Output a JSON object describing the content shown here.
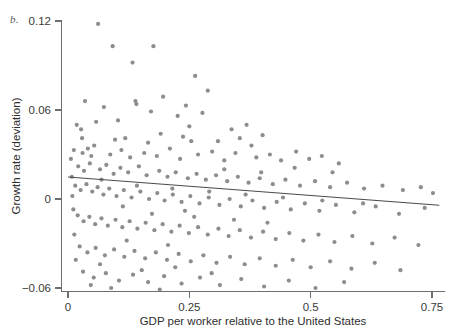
{
  "figure": {
    "panel_label": "b.",
    "background_color": "#ffffff"
  },
  "chart_data": {
    "type": "scatter",
    "title": "",
    "subtitle": "",
    "xlabel": "GDP per worker relative to the United States",
    "ylabel": "Growth rate (deviation)",
    "xlim": [
      0,
      0.78
    ],
    "ylim": [
      -0.068,
      0.125
    ],
    "xticks": [
      0,
      0.25,
      0.5,
      0.75
    ],
    "xtick_labels": [
      "0",
      "0.25",
      "0.5",
      "0.75"
    ],
    "yticks": [
      -0.06,
      0,
      0.06,
      0.12
    ],
    "ytick_labels": [
      "−0.06",
      "0",
      "0.06",
      "0.12"
    ],
    "grid": false,
    "legend": null,
    "marker": {
      "shape": "circle",
      "color": "#8d8d8d",
      "size_px": 4.2
    },
    "trend_line": {
      "type": "linear-fit",
      "color": "#4a4a4a",
      "x_start": 0.0,
      "y_start": 0.0148,
      "x_end": 0.765,
      "y_end": -0.0042,
      "slope": -0.0248,
      "intercept": 0.0148
    },
    "points": [
      [
        0.062,
        0.118
      ],
      [
        0.092,
        0.103
      ],
      [
        0.133,
        0.092
      ],
      [
        0.176,
        0.103
      ],
      [
        0.262,
        0.083
      ],
      [
        0.288,
        0.073
      ],
      [
        0.035,
        0.066
      ],
      [
        0.074,
        0.062
      ],
      [
        0.139,
        0.066
      ],
      [
        0.141,
        0.064
      ],
      [
        0.171,
        0.059
      ],
      [
        0.196,
        0.069
      ],
      [
        0.243,
        0.063
      ],
      [
        0.277,
        0.058
      ],
      [
        0.018,
        0.05
      ],
      [
        0.027,
        0.047
      ],
      [
        0.058,
        0.052
      ],
      [
        0.103,
        0.053
      ],
      [
        0.226,
        0.056
      ],
      [
        0.25,
        0.049
      ],
      [
        0.337,
        0.047
      ],
      [
        0.368,
        0.05
      ],
      [
        0.097,
        0.04
      ],
      [
        0.118,
        0.041
      ],
      [
        0.165,
        0.038
      ],
      [
        0.191,
        0.044
      ],
      [
        0.237,
        0.042
      ],
      [
        0.254,
        0.039
      ],
      [
        0.309,
        0.039
      ],
      [
        0.354,
        0.041
      ],
      [
        0.378,
        0.036
      ],
      [
        0.401,
        0.043
      ],
      [
        0.012,
        0.033
      ],
      [
        0.03,
        0.031
      ],
      [
        0.041,
        0.034
      ],
      [
        0.048,
        0.029
      ],
      [
        0.054,
        0.036
      ],
      [
        0.087,
        0.03
      ],
      [
        0.11,
        0.033
      ],
      [
        0.128,
        0.028
      ],
      [
        0.157,
        0.031
      ],
      [
        0.183,
        0.029
      ],
      [
        0.21,
        0.034
      ],
      [
        0.231,
        0.027
      ],
      [
        0.268,
        0.03
      ],
      [
        0.297,
        0.032
      ],
      [
        0.322,
        0.026
      ],
      [
        0.345,
        0.031
      ],
      [
        0.388,
        0.028
      ],
      [
        0.416,
        0.03
      ],
      [
        0.439,
        0.026
      ],
      [
        0.47,
        0.032
      ],
      [
        0.497,
        0.027
      ],
      [
        0.523,
        0.029
      ],
      [
        0.558,
        0.024
      ],
      [
        0.021,
        0.022
      ],
      [
        0.033,
        0.019
      ],
      [
        0.045,
        0.024
      ],
      [
        0.066,
        0.02
      ],
      [
        0.079,
        0.023
      ],
      [
        0.094,
        0.017
      ],
      [
        0.108,
        0.021
      ],
      [
        0.124,
        0.018
      ],
      [
        0.146,
        0.022
      ],
      [
        0.162,
        0.016
      ],
      [
        0.188,
        0.019
      ],
      [
        0.205,
        0.015
      ],
      [
        0.222,
        0.018
      ],
      [
        0.247,
        0.014
      ],
      [
        0.265,
        0.017
      ],
      [
        0.284,
        0.013
      ],
      [
        0.305,
        0.016
      ],
      [
        0.328,
        0.012
      ],
      [
        0.35,
        0.015
      ],
      [
        0.372,
        0.011
      ],
      [
        0.395,
        0.014
      ],
      [
        0.422,
        0.01
      ],
      [
        0.448,
        0.013
      ],
      [
        0.478,
        0.009
      ],
      [
        0.509,
        0.012
      ],
      [
        0.54,
        0.008
      ],
      [
        0.575,
        0.011
      ],
      [
        0.61,
        0.007
      ],
      [
        0.648,
        0.009
      ],
      [
        0.69,
        0.006
      ],
      [
        0.727,
        0.008
      ],
      [
        0.752,
        0.004
      ],
      [
        0.015,
        0.009
      ],
      [
        0.026,
        0.006
      ],
      [
        0.038,
        0.01
      ],
      [
        0.05,
        0.005
      ],
      [
        0.061,
        0.008
      ],
      [
        0.073,
        0.003
      ],
      [
        0.085,
        0.007
      ],
      [
        0.1,
        0.002
      ],
      [
        0.115,
        0.006
      ],
      [
        0.131,
        0.001
      ],
      [
        0.149,
        0.005
      ],
      [
        0.167,
        0.0
      ],
      [
        0.184,
        0.004
      ],
      [
        0.199,
        -0.001
      ],
      [
        0.216,
        0.003
      ],
      [
        0.234,
        -0.002
      ],
      [
        0.252,
        0.002
      ],
      [
        0.271,
        -0.003
      ],
      [
        0.29,
        0.001
      ],
      [
        0.312,
        -0.004
      ],
      [
        0.333,
        0.0
      ],
      [
        0.356,
        -0.005
      ],
      [
        0.38,
        -0.001
      ],
      [
        0.404,
        -0.006
      ],
      [
        0.43,
        -0.002
      ],
      [
        0.459,
        -0.007
      ],
      [
        0.488,
        -0.003
      ],
      [
        0.518,
        -0.008
      ],
      [
        0.552,
        -0.004
      ],
      [
        0.59,
        -0.009
      ],
      [
        0.634,
        -0.005
      ],
      [
        0.682,
        -0.01
      ],
      [
        0.735,
        -0.006
      ],
      [
        0.02,
        -0.011
      ],
      [
        0.032,
        -0.015
      ],
      [
        0.044,
        -0.012
      ],
      [
        0.056,
        -0.017
      ],
      [
        0.069,
        -0.013
      ],
      [
        0.082,
        -0.018
      ],
      [
        0.098,
        -0.014
      ],
      [
        0.112,
        -0.019
      ],
      [
        0.127,
        -0.015
      ],
      [
        0.143,
        -0.02
      ],
      [
        0.16,
        -0.016
      ],
      [
        0.178,
        -0.021
      ],
      [
        0.195,
        -0.017
      ],
      [
        0.213,
        -0.022
      ],
      [
        0.23,
        -0.018
      ],
      [
        0.249,
        -0.023
      ],
      [
        0.268,
        -0.019
      ],
      [
        0.288,
        -0.024
      ],
      [
        0.31,
        -0.02
      ],
      [
        0.331,
        -0.025
      ],
      [
        0.354,
        -0.021
      ],
      [
        0.377,
        -0.026
      ],
      [
        0.402,
        -0.022
      ],
      [
        0.428,
        -0.027
      ],
      [
        0.456,
        -0.023
      ],
      [
        0.485,
        -0.028
      ],
      [
        0.516,
        -0.024
      ],
      [
        0.549,
        -0.029
      ],
      [
        0.586,
        -0.025
      ],
      [
        0.627,
        -0.03
      ],
      [
        0.673,
        -0.026
      ],
      [
        0.722,
        -0.031
      ],
      [
        0.024,
        -0.032
      ],
      [
        0.04,
        -0.036
      ],
      [
        0.057,
        -0.033
      ],
      [
        0.076,
        -0.038
      ],
      [
        0.095,
        -0.034
      ],
      [
        0.116,
        -0.039
      ],
      [
        0.137,
        -0.035
      ],
      [
        0.159,
        -0.04
      ],
      [
        0.181,
        -0.036
      ],
      [
        0.204,
        -0.041
      ],
      [
        0.228,
        -0.037
      ],
      [
        0.253,
        -0.042
      ],
      [
        0.279,
        -0.038
      ],
      [
        0.306,
        -0.043
      ],
      [
        0.334,
        -0.039
      ],
      [
        0.364,
        -0.044
      ],
      [
        0.395,
        -0.04
      ],
      [
        0.428,
        -0.045
      ],
      [
        0.463,
        -0.041
      ],
      [
        0.5,
        -0.046
      ],
      [
        0.54,
        -0.042
      ],
      [
        0.584,
        -0.047
      ],
      [
        0.632,
        -0.043
      ],
      [
        0.685,
        -0.048
      ],
      [
        0.031,
        -0.049
      ],
      [
        0.053,
        -0.053
      ],
      [
        0.078,
        -0.05
      ],
      [
        0.105,
        -0.055
      ],
      [
        0.134,
        -0.051
      ],
      [
        0.165,
        -0.056
      ],
      [
        0.198,
        -0.052
      ],
      [
        0.234,
        -0.057
      ],
      [
        0.272,
        -0.053
      ],
      [
        0.313,
        -0.058
      ],
      [
        0.357,
        -0.054
      ],
      [
        0.404,
        -0.059
      ],
      [
        0.455,
        -0.055
      ],
      [
        0.51,
        -0.06
      ],
      [
        0.569,
        -0.056
      ],
      [
        0.066,
        -0.044
      ],
      [
        0.152,
        -0.048
      ],
      [
        0.221,
        -0.046
      ],
      [
        0.296,
        -0.05
      ],
      [
        0.047,
        -0.058
      ],
      [
        0.089,
        -0.06
      ],
      [
        0.189,
        -0.061
      ],
      [
        0.121,
        -0.028
      ],
      [
        0.206,
        -0.031
      ],
      [
        0.173,
        -0.01
      ],
      [
        0.26,
        -0.012
      ],
      [
        0.342,
        -0.014
      ],
      [
        0.411,
        -0.016
      ],
      [
        0.069,
        0.013
      ],
      [
        0.142,
        0.009
      ],
      [
        0.215,
        0.007
      ],
      [
        0.291,
        0.005
      ],
      [
        0.366,
        0.003
      ],
      [
        0.443,
        0.001
      ],
      [
        0.524,
        -0.001
      ],
      [
        0.608,
        -0.003
      ],
      [
        0.113,
        -0.005
      ],
      [
        0.241,
        -0.008
      ],
      [
        0.322,
        0.02
      ],
      [
        0.398,
        0.018
      ],
      [
        0.467,
        0.021
      ],
      [
        0.545,
        0.018
      ],
      [
        0.029,
        0.041
      ],
      [
        0.008,
        0.015
      ],
      [
        0.009,
        0.002
      ],
      [
        0.011,
        -0.007
      ],
      [
        0.013,
        -0.024
      ],
      [
        0.016,
        -0.041
      ],
      [
        0.006,
        0.027
      ]
    ]
  },
  "axes": {
    "x_axis_name": "x-axis",
    "y_axis_name": "y-axis"
  }
}
